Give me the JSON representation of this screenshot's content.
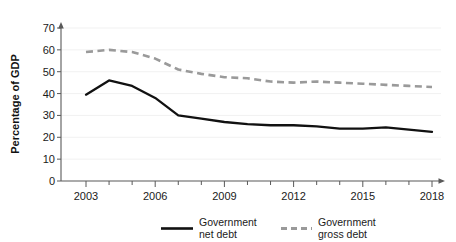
{
  "chart_data": {
    "type": "line",
    "title": "",
    "xlabel": "",
    "ylabel": "Percentage of GDP",
    "xlim": [
      2003,
      2018
    ],
    "ylim": [
      0,
      70
    ],
    "grid": true,
    "legend_position": "bottom",
    "x": [
      2003,
      2004,
      2005,
      2006,
      2007,
      2008,
      2009,
      2010,
      2011,
      2012,
      2013,
      2014,
      2015,
      2016,
      2017,
      2018
    ],
    "xtick_labels": [
      "2003",
      "2006",
      "2009",
      "2012",
      "2015",
      "2018"
    ],
    "xtick_values": [
      2003,
      2006,
      2009,
      2012,
      2015,
      2018
    ],
    "ytick_labels": [
      "0",
      "10",
      "20",
      "30",
      "40",
      "50",
      "60",
      "70"
    ],
    "ytick_values": [
      0,
      10,
      20,
      30,
      40,
      50,
      60,
      70
    ],
    "series": [
      {
        "name": "Government net debt",
        "style": "solid",
        "color": "#111111",
        "values": [
          39.5,
          46.0,
          43.5,
          38.0,
          30.0,
          28.5,
          27.0,
          26.0,
          25.5,
          25.5,
          25.0,
          24.0,
          24.0,
          24.5,
          23.5,
          22.5
        ]
      },
      {
        "name": "Government gross debt",
        "style": "dashed",
        "color": "#9a9a9a",
        "values": [
          59.0,
          60.0,
          59.0,
          56.0,
          51.0,
          49.0,
          47.5,
          47.0,
          45.5,
          45.0,
          45.5,
          45.0,
          44.5,
          44.0,
          43.5,
          43.0
        ]
      }
    ]
  },
  "axes": {
    "ylabel": "Percentage of GDP"
  },
  "legend": {
    "items": [
      {
        "label_line1": "Government",
        "label_line2": "net debt",
        "swatch": "solid-line-swatch"
      },
      {
        "label_line1": "Government",
        "label_line2": "gross debt",
        "swatch": "dashed-line-swatch"
      }
    ]
  },
  "colors": {
    "net_debt": "#111111",
    "gross_debt": "#9a9a9a",
    "axis": "#595959",
    "grid": "#ededed",
    "background": "#ffffff"
  }
}
